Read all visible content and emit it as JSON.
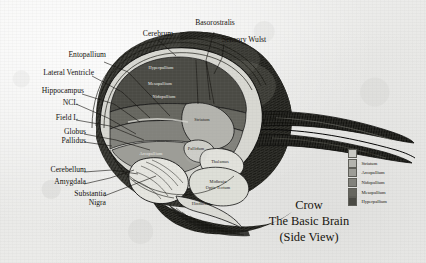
{
  "figure": {
    "title_lines": [
      "Crow",
      "The Basic Brain",
      "(Side View)"
    ]
  },
  "callout_labels": [
    {
      "key": "cerebrum",
      "text": "Cerebrum"
    },
    {
      "key": "basorostralis",
      "text": "Basorostralis"
    },
    {
      "key": "sensory_wulst",
      "text": "Sensory Wulst"
    },
    {
      "key": "entopallium",
      "text": "Entopallium"
    },
    {
      "key": "lateral_ventricle",
      "text": "Lateral Ventricle"
    },
    {
      "key": "hippocampus",
      "text": "Hippocampus"
    },
    {
      "key": "ncl",
      "text": "NCL"
    },
    {
      "key": "field_l",
      "text": "Field L"
    },
    {
      "key": "globus",
      "text": "Globus"
    },
    {
      "key": "pallidus",
      "text": "Pallidus"
    },
    {
      "key": "cerebellum",
      "text": "Cerebellum"
    },
    {
      "key": "amygdala",
      "text": "Amygdala"
    },
    {
      "key": "substantia",
      "text": "Substantia"
    },
    {
      "key": "nigra",
      "text": "Nigra"
    }
  ],
  "interior_labels": [
    {
      "key": "hyperpallium",
      "text": "Hyperpallium"
    },
    {
      "key": "mesopallium",
      "text": "Mesopallium"
    },
    {
      "key": "nidopallium",
      "text": "Nidopallium"
    },
    {
      "key": "striatum",
      "text": "Striatum"
    },
    {
      "key": "pallidum",
      "text": "Pallidum"
    },
    {
      "key": "arcopallium",
      "text": "Arcopallium"
    },
    {
      "key": "thalamus",
      "text": "Thalamus"
    },
    {
      "key": "midbrain",
      "text": "Midbrain"
    },
    {
      "key": "optic_tectum",
      "text": "Optic Tectum"
    },
    {
      "key": "hindbrain",
      "text": "Hindbrain"
    }
  ],
  "legend": {
    "items": [
      {
        "label": "Pallidum",
        "color": "#c9c9c4"
      },
      {
        "label": "Striatum",
        "color": "#b4b4ae"
      },
      {
        "label": "Arcopallium",
        "color": "#9d9d97"
      },
      {
        "label": "Nidopallium",
        "color": "#82827c"
      },
      {
        "label": "Mesopallium",
        "color": "#66665f"
      },
      {
        "label": "Hyperpallium",
        "color": "#4a4a44"
      }
    ]
  },
  "palette": {
    "paper": "#efefed",
    "ink": "#15130f",
    "plumage_dark": "#2b2b27",
    "beak_dark": "#1d1d1a"
  }
}
